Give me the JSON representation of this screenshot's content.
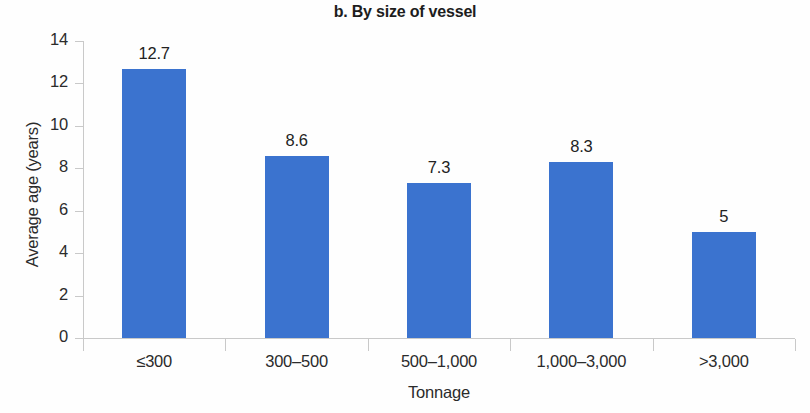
{
  "chart_data": {
    "type": "bar",
    "title": "b. By size of vessel",
    "xlabel": "Tonnage",
    "ylabel": "Average age (years)",
    "categories": [
      "≤300",
      "300–500",
      "500–1,000",
      "1,000–3,000",
      ">3,000"
    ],
    "values": [
      12.7,
      8.6,
      7.3,
      8.3,
      5
    ],
    "value_labels": [
      "12.7",
      "8.6",
      "7.3",
      "8.3",
      "5"
    ],
    "ylim": [
      0,
      14
    ],
    "yticks": [
      0,
      2,
      4,
      6,
      8,
      10,
      12,
      14
    ],
    "ytick_labels": [
      "0",
      "2",
      "4",
      "6",
      "8",
      "10",
      "12",
      "14"
    ],
    "grid": false,
    "legend": "none",
    "bar_color": "#3b73cf",
    "axis_color": "#c9c9c9",
    "text_color": "#2b2b2b",
    "background": "#ffffff"
  }
}
